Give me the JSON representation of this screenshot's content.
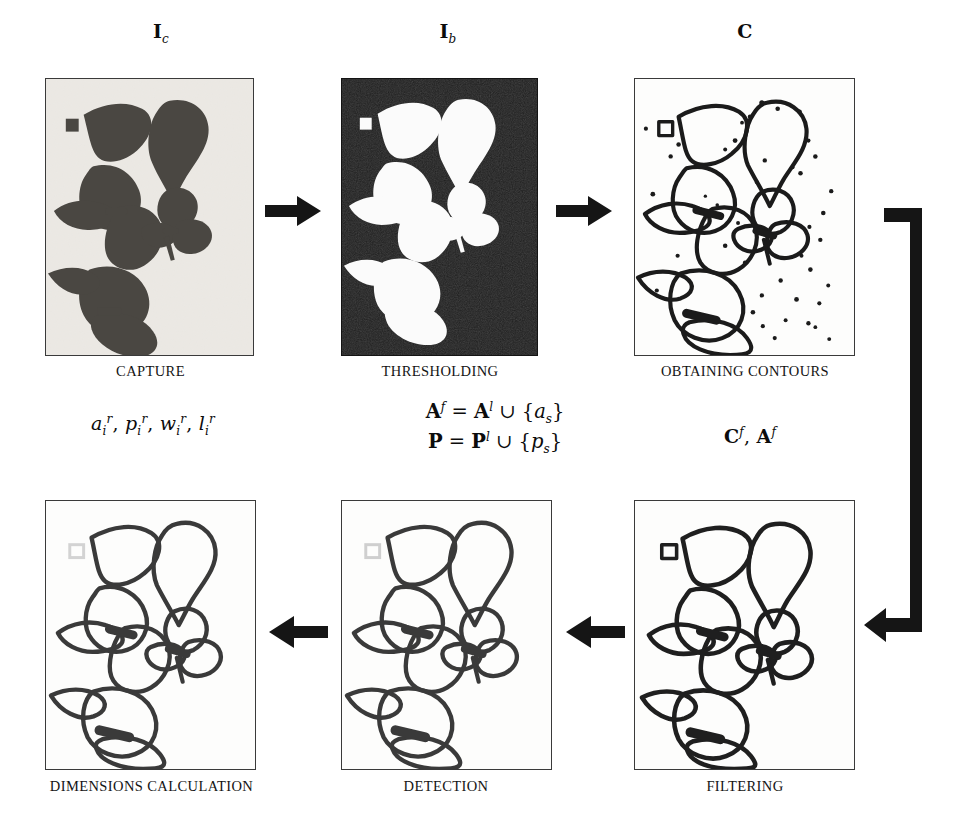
{
  "figure": {
    "type": "pipeline-diagram",
    "background": "#ffffff",
    "ink": "#141414"
  },
  "top_row": {
    "stages": [
      {
        "id": "capture",
        "symbol_main": "I",
        "symbol_sub": "c",
        "caption": "CAPTURE",
        "panel_kind": "photo",
        "description": "Grayscale photograph of dark leaves on a light background with a small dark square reference marker"
      },
      {
        "id": "thresholding",
        "symbol_main": "I",
        "symbol_sub": "b",
        "caption": "THRESHOLDING",
        "panel_kind": "binary",
        "description": "Binary image: white leaf silhouettes and white square marker on black background"
      },
      {
        "id": "obtaining-contours",
        "symbol_main": "C",
        "symbol_sub": "",
        "caption": "OBTAINING CONTOURS",
        "panel_kind": "contours-noisy",
        "description": "Leaf outlines plus many small noise blobs and the square marker outline"
      }
    ]
  },
  "bottom_row": {
    "stages": [
      {
        "id": "dimensions-calculation",
        "caption": "DIMENSIONS CALCULATION",
        "panel_kind": "contours-clean",
        "marker": "faint",
        "description": "Clean leaf contours, marker removed (shown faint)"
      },
      {
        "id": "detection",
        "caption": "DETECTION",
        "panel_kind": "contours-clean",
        "marker": "faint",
        "description": "Clean leaf contours with the detected marker highlighted faintly"
      },
      {
        "id": "filtering",
        "caption": "FILTERING",
        "panel_kind": "contours-clean",
        "marker": "solid",
        "description": "Noise blobs filtered out; leaf contours and square marker outline remain"
      }
    ]
  },
  "annotations": {
    "dimensions_symbols": {
      "parts": [
        {
          "base": "a",
          "sub": "i",
          "sup": "r"
        },
        {
          "base": "p",
          "sub": "i",
          "sup": "r"
        },
        {
          "base": "w",
          "sub": "i",
          "sup": "r"
        },
        {
          "base": "l",
          "sub": "i",
          "sup": "r"
        }
      ],
      "plain": "a_i^r, p_i^r, w_i^r, l_i^r"
    },
    "filtering_symbols": {
      "plain": "C^f, A^f",
      "parts": [
        {
          "base": "C",
          "sup": "f"
        },
        {
          "base": "A",
          "sup": "f"
        }
      ]
    },
    "equations": [
      {
        "lhs": "A",
        "lhs_sup": "f",
        "rel": "=",
        "rhs_base": "A",
        "rhs_sup": "l",
        "op": "∪",
        "set": "{a",
        "set_sub": "s",
        "set_close": "}",
        "plain": "A^f = A^l ∪ {a_s}"
      },
      {
        "lhs": "P",
        "lhs_sup": "",
        "rel": "=",
        "rhs_base": "P",
        "rhs_sup": "l",
        "op": "∪",
        "set": "{p",
        "set_sub": "s",
        "set_close": "}",
        "plain": "P = P^l ∪ {p_s}"
      }
    ]
  },
  "arrows": [
    {
      "id": "arrow-capture-to-threshold",
      "direction": "right"
    },
    {
      "id": "arrow-threshold-to-contours",
      "direction": "right"
    },
    {
      "id": "arrow-contours-to-filtering",
      "direction": "elbow-down-left"
    },
    {
      "id": "arrow-filtering-to-detection",
      "direction": "left"
    },
    {
      "id": "arrow-detection-to-dimensions",
      "direction": "left"
    }
  ]
}
